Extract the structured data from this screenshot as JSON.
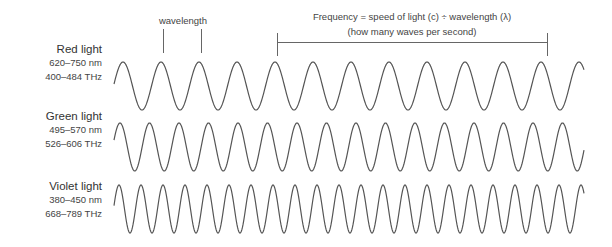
{
  "annotations": {
    "wavelength": "wavelength",
    "frequency_line1": "Frequency = speed of light (c) ÷ wavelength (λ)",
    "frequency_line2": "(how many waves per second)"
  },
  "waves": [
    {
      "name": "Red light",
      "wavelength_range": "620–750 nm",
      "frequency_range": "400–484 THz",
      "period_px": 38,
      "first_peak_x": 123,
      "center_y": 86,
      "amplitude": 24
    },
    {
      "name": "Green light",
      "wavelength_range": "495–570 nm",
      "frequency_range": "526–606 THz",
      "period_px": 29.5,
      "first_peak_x": 120,
      "center_y": 147,
      "amplitude": 24
    },
    {
      "name": "Violet light",
      "wavelength_range": "380–450 nm",
      "frequency_range": "668–789 THz",
      "period_px": 22,
      "first_peak_x": 119,
      "center_y": 209,
      "amplitude": 24
    }
  ],
  "colors": {
    "stroke": "#555555",
    "text": "#333333"
  }
}
